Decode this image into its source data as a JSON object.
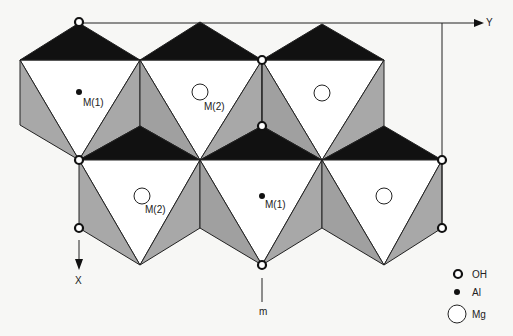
{
  "diagram": {
    "axes": {
      "y_label": "Y",
      "x_label": "X",
      "mirror_label": "m"
    },
    "site_labels": [
      {
        "id": "m1-top",
        "text": "M(1)",
        "x": 86,
        "y": 68
      },
      {
        "id": "m2-top",
        "text": "M(2)",
        "x": 204,
        "y": 101
      },
      {
        "id": "m2-bottom",
        "text": "M(2)",
        "x": 145,
        "y": 208
      },
      {
        "id": "m1-bottom",
        "text": "M(1)",
        "x": 265,
        "y": 200
      }
    ],
    "legend": [
      {
        "symbol": "OH",
        "label": "OH"
      },
      {
        "symbol": "Al",
        "label": "Al"
      },
      {
        "symbol": "Mg",
        "label": "Mg"
      }
    ],
    "colors": {
      "black": "#111111",
      "grey": "#a6a6a6",
      "white": "#ffffff",
      "line": "#222222"
    }
  }
}
